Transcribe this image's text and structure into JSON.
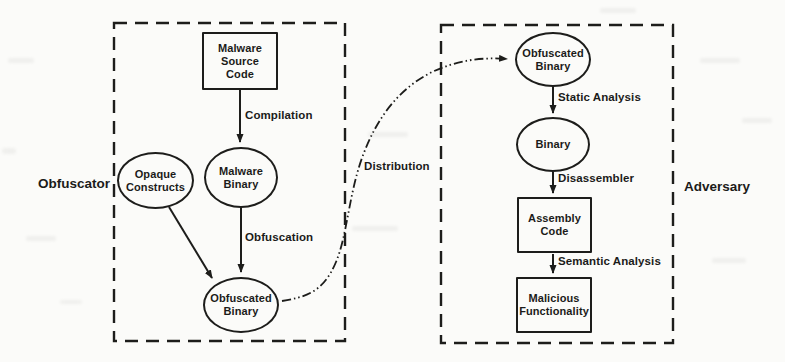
{
  "diagram": {
    "groups": {
      "left_label": "Obfuscator",
      "right_label": "Adversary"
    },
    "nodes": {
      "malware_source_code": "Malware\nSource\nCode",
      "opaque_constructs": "Opaque\nConstructs",
      "malware_binary": "Malware\nBinary",
      "obfuscated_binary_left": "Obfuscated\nBinary",
      "obfuscated_binary_right": "Obfuscated\nBinary",
      "binary": "Binary",
      "assembly_code": "Assembly\nCode",
      "malicious_functionality": "Malicious\nFunctionality"
    },
    "edge_labels": {
      "compilation": "Compilation",
      "obfuscation": "Obfuscation",
      "distribution": "Distribution",
      "static_analysis": "Static Analysis",
      "disassembler": "Disassembler",
      "semantic_analysis": "Semantic Analysis"
    },
    "colors": {
      "line": "#1d1d1b",
      "background": "#fbfbf9"
    }
  }
}
